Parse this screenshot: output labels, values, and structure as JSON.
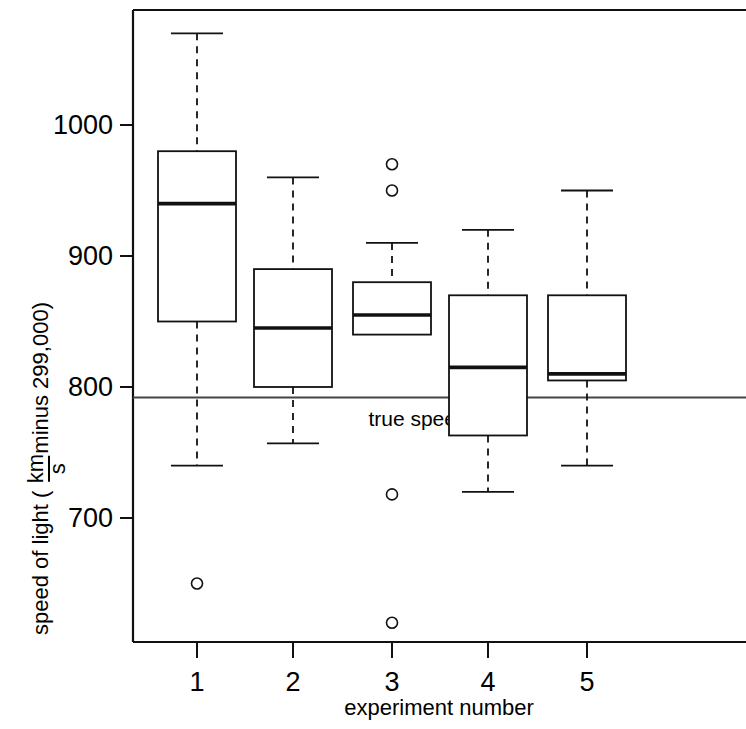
{
  "chart_data": {
    "type": "box",
    "title": "",
    "xlabel": "experiment number",
    "ylabel_parts": {
      "prefix": "speed of light (",
      "numerator": "km",
      "denominator": "s",
      "suffix": " minus 299,000)"
    },
    "ylabel": "speed of light (km/s minus 299,000)",
    "categories": [
      "1",
      "2",
      "3",
      "4",
      "5"
    ],
    "xtick_labels": [
      "1",
      "2",
      "3",
      "4",
      "5"
    ],
    "ytick_labels": [
      "1000",
      "900",
      "800",
      "700"
    ],
    "yticks": [
      1000,
      900,
      800,
      700
    ],
    "ylim": [
      600,
      1090
    ],
    "xlim": [
      0.4,
      5.9
    ],
    "grid": false,
    "legend": "none",
    "reference_line": {
      "label": "true speed",
      "value": 792,
      "color": "#444444"
    },
    "boxes": [
      {
        "category": "1",
        "whisker_high": 1070,
        "q3": 980,
        "median": 940,
        "q1": 850,
        "whisker_low": 740,
        "outliers": [
          650
        ]
      },
      {
        "category": "2",
        "whisker_high": 960,
        "q3": 890,
        "median": 845,
        "q1": 800,
        "whisker_low": 757,
        "outliers": []
      },
      {
        "category": "3",
        "whisker_high": 910,
        "q3": 880,
        "median": 855,
        "q1": 840,
        "whisker_low": 840,
        "outliers": [
          970,
          950,
          718,
          620
        ]
      },
      {
        "category": "4",
        "whisker_high": 920,
        "q3": 870,
        "median": 815,
        "q1": 763,
        "whisker_low": 720,
        "outliers": []
      },
      {
        "category": "5",
        "whisker_high": 950,
        "q3": 870,
        "median": 810,
        "q1": 805,
        "whisker_low": 740,
        "outliers": []
      }
    ]
  },
  "axis": {
    "x_title": "experiment number",
    "y_prefix": "speed of light (",
    "y_num": "km",
    "y_den": "s",
    "y_suffix": " minus 299,000)",
    "y_labels": [
      "1000",
      "900",
      "800",
      "700"
    ],
    "x_labels": [
      "1",
      "2",
      "3",
      "4",
      "5"
    ]
  },
  "annotations": {
    "true_speed": "true speed"
  }
}
